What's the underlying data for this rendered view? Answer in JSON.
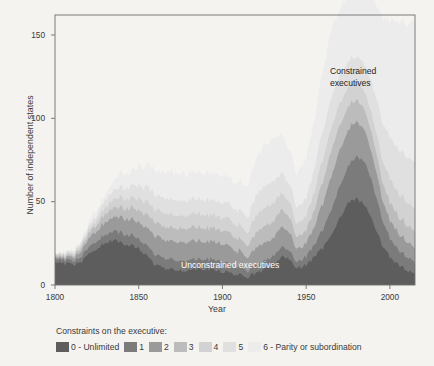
{
  "chart_data": {
    "type": "area",
    "title": "",
    "xlabel": "Year",
    "ylabel": "Number of independent states",
    "xlim": [
      1800,
      2015
    ],
    "ylim": [
      0,
      162
    ],
    "xticks": [
      1800,
      1850,
      1900,
      1950,
      2000
    ],
    "yticks": [
      0,
      50,
      100,
      150
    ],
    "grid": false,
    "stacked": true,
    "legend_position": "below",
    "legend_title": "Constraints on the executive:",
    "annotations": [
      {
        "text": "Constrained\nexecutives",
        "x": 1965,
        "y": 125,
        "color": "#242424"
      },
      {
        "text": "Unconstrained executives",
        "x": 1893,
        "y": 6,
        "color": "#ffffff"
      }
    ],
    "series": [
      {
        "name": "0 - Unlimited",
        "color": "#5d5d5d",
        "label": "0 - Unlimited"
      },
      {
        "name": "1",
        "color": "#7b7b7b",
        "label": "1"
      },
      {
        "name": "2",
        "color": "#9a9a9a",
        "label": "2"
      },
      {
        "name": "3",
        "color": "#bcbcbc",
        "label": "3"
      },
      {
        "name": "4",
        "color": "#d2d2d2",
        "label": "4"
      },
      {
        "name": "5",
        "color": "#e0e0e0",
        "label": "5"
      },
      {
        "name": "6 - Parity or subordination",
        "color": "#ececec",
        "label": "6 - Parity or subordination"
      }
    ],
    "x": [
      1800,
      1805,
      1810,
      1815,
      1820,
      1825,
      1830,
      1835,
      1840,
      1845,
      1850,
      1855,
      1860,
      1865,
      1870,
      1875,
      1880,
      1885,
      1890,
      1895,
      1900,
      1905,
      1910,
      1915,
      1920,
      1925,
      1930,
      1935,
      1940,
      1945,
      1950,
      1955,
      1960,
      1965,
      1970,
      1975,
      1980,
      1985,
      1990,
      1995,
      2000,
      2005,
      2010,
      2015
    ],
    "values": {
      "0": [
        13,
        13,
        12,
        13,
        18,
        22,
        25,
        27,
        25,
        24,
        22,
        17,
        12,
        10,
        9,
        9,
        9,
        10,
        10,
        9,
        8,
        7,
        6,
        5,
        7,
        9,
        12,
        17,
        15,
        10,
        12,
        17,
        22,
        31,
        40,
        49,
        52,
        48,
        38,
        25,
        17,
        12,
        9,
        7
      ],
      "1": [
        2,
        2,
        2,
        3,
        4,
        5,
        5,
        5,
        6,
        6,
        6,
        6,
        6,
        6,
        6,
        6,
        6,
        6,
        6,
        6,
        6,
        5,
        5,
        4,
        5,
        5,
        5,
        6,
        5,
        4,
        5,
        7,
        11,
        15,
        19,
        22,
        25,
        26,
        22,
        16,
        11,
        9,
        8,
        7
      ],
      "2": [
        1,
        1,
        2,
        3,
        5,
        6,
        7,
        8,
        9,
        9,
        10,
        11,
        11,
        11,
        11,
        11,
        11,
        11,
        11,
        11,
        11,
        10,
        9,
        8,
        10,
        11,
        11,
        12,
        11,
        8,
        8,
        11,
        16,
        20,
        22,
        22,
        21,
        19,
        16,
        13,
        11,
        10,
        9,
        9
      ],
      "3": [
        1,
        1,
        1,
        2,
        3,
        4,
        5,
        6,
        6,
        7,
        7,
        8,
        8,
        8,
        8,
        8,
        8,
        8,
        8,
        8,
        8,
        8,
        7,
        7,
        9,
        10,
        10,
        10,
        9,
        7,
        8,
        10,
        13,
        15,
        15,
        14,
        13,
        12,
        12,
        11,
        11,
        10,
        10,
        10
      ],
      "4": [
        1,
        1,
        1,
        2,
        2,
        3,
        4,
        5,
        6,
        6,
        7,
        8,
        8,
        8,
        8,
        8,
        8,
        8,
        8,
        8,
        8,
        8,
        8,
        8,
        10,
        11,
        11,
        10,
        9,
        8,
        9,
        11,
        13,
        14,
        13,
        12,
        11,
        11,
        12,
        13,
        14,
        14,
        14,
        14
      ],
      "5": [
        0,
        1,
        1,
        1,
        2,
        3,
        4,
        5,
        6,
        7,
        8,
        9,
        9,
        9,
        9,
        9,
        9,
        9,
        9,
        9,
        9,
        9,
        9,
        9,
        12,
        13,
        13,
        12,
        11,
        10,
        11,
        14,
        17,
        18,
        17,
        16,
        15,
        16,
        19,
        22,
        25,
        26,
        27,
        28
      ],
      "6": [
        0,
        0,
        1,
        1,
        2,
        3,
        4,
        6,
        8,
        9,
        11,
        13,
        14,
        15,
        16,
        16,
        16,
        16,
        16,
        16,
        16,
        16,
        17,
        18,
        22,
        24,
        25,
        23,
        21,
        20,
        24,
        30,
        36,
        40,
        40,
        39,
        40,
        44,
        52,
        62,
        70,
        76,
        80,
        84
      ]
    }
  }
}
